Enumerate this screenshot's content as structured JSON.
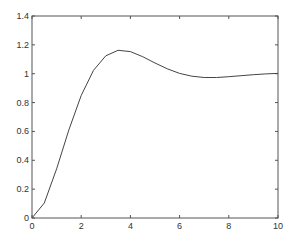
{
  "chart_data": {
    "type": "line",
    "title": "",
    "xlabel": "",
    "ylabel": "",
    "xlim": [
      0,
      10
    ],
    "ylim": [
      0,
      1.4
    ],
    "grid": false,
    "legend": null,
    "x_ticks": [
      "0",
      "2",
      "4",
      "6",
      "8",
      "10"
    ],
    "y_ticks": [
      "0",
      "0.2",
      "0.4",
      "0.6",
      "0.8",
      "1",
      "1.2",
      "1.4"
    ],
    "series": [
      {
        "name": "step response",
        "color": "#444444",
        "x": [
          0,
          0.5,
          1,
          1.5,
          2,
          2.5,
          3,
          3.5,
          4,
          4.5,
          5,
          5.5,
          6,
          6.5,
          7,
          7.5,
          8,
          8.5,
          9,
          9.5,
          10
        ],
        "y": [
          0,
          0.104,
          0.34,
          0.611,
          0.849,
          1.024,
          1.124,
          1.162,
          1.153,
          1.118,
          1.074,
          1.034,
          1.002,
          0.983,
          0.974,
          0.974,
          0.979,
          0.986,
          0.993,
          0.999,
          1.002
        ]
      }
    ]
  }
}
